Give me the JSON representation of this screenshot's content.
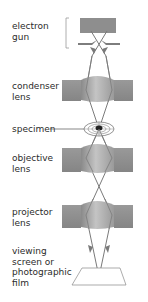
{
  "diagram": {
    "type": "transmission electron microscope schematic",
    "labels": {
      "electron_gun": "electron\ngun",
      "condenser_lens": "condenser\nlens",
      "specimen": "specimen",
      "objective_lens": "objective\nlens",
      "projector_lens": "projector\nlens",
      "viewing_screen": "viewing\nscreen or\nphotographic\nfilm"
    },
    "colors": {
      "lens_block": "#8c8c8c",
      "lens_dome": "#a8a8a8",
      "beam": "#7a7a7a",
      "text": "#2b2b2b",
      "bracket": "#9a9a9a"
    }
  }
}
